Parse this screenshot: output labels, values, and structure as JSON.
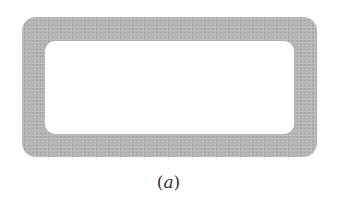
{
  "figure": {
    "shape": "rounded-rectangle-ring",
    "fill_color": "#b5b5b5",
    "inner_color": "#ffffff",
    "caption": {
      "open": "(",
      "variable": "a",
      "close": ")"
    }
  }
}
